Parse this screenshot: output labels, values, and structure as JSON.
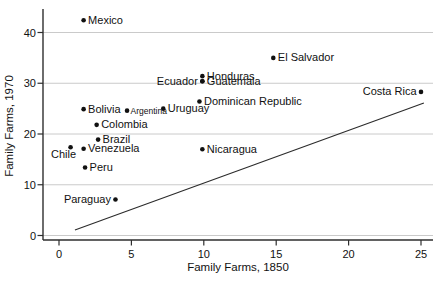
{
  "chart_data": {
    "type": "scatter",
    "title": "",
    "xlabel": "Family Farms, 1850",
    "ylabel": "Family Farms, 1970",
    "xlim": [
      0,
      25
    ],
    "ylim": [
      0,
      44
    ],
    "xticks": [
      0,
      5,
      10,
      15,
      20,
      25
    ],
    "yticks": [
      0,
      10,
      20,
      30,
      40
    ],
    "grid": "horizontal-gridlines-only",
    "legend": "none",
    "points": [
      {
        "label": "Mexico",
        "x": 1.7,
        "y": 42.4,
        "label_side": "right"
      },
      {
        "label": "El Salvador",
        "x": 14.8,
        "y": 35.0,
        "label_side": "right"
      },
      {
        "label": "Honduras",
        "x": 9.9,
        "y": 31.4,
        "label_side": "right"
      },
      {
        "label": "Ecuador",
        "x": 9.9,
        "y": 30.4,
        "label_side": "left"
      },
      {
        "label": "Guatemala",
        "x": 9.9,
        "y": 30.4,
        "label_side": "right"
      },
      {
        "label": "Costa Rica",
        "x": 25.0,
        "y": 28.3,
        "label_side": "left"
      },
      {
        "label": "Dominican Republic",
        "x": 9.7,
        "y": 26.4,
        "label_side": "right"
      },
      {
        "label": "Uruguay",
        "x": 7.2,
        "y": 25.0,
        "label_side": "right"
      },
      {
        "label": "Bolivia",
        "x": 1.7,
        "y": 24.9,
        "label_side": "right"
      },
      {
        "label": "Argentina",
        "x": 4.7,
        "y": 24.6,
        "label_side": "right",
        "small": true
      },
      {
        "label": "Colombia",
        "x": 2.6,
        "y": 21.8,
        "label_side": "right"
      },
      {
        "label": "Brazil",
        "x": 2.7,
        "y": 18.9,
        "label_side": "right"
      },
      {
        "label": "Chile",
        "x": 0.8,
        "y": 17.4,
        "label_side": "below-left"
      },
      {
        "label": "Venezuela",
        "x": 1.7,
        "y": 17.1,
        "label_side": "right"
      },
      {
        "label": "Nicaragua",
        "x": 9.9,
        "y": 17.0,
        "label_side": "right"
      },
      {
        "label": "Peru",
        "x": 1.8,
        "y": 13.4,
        "label_side": "right"
      },
      {
        "label": "Paraguay",
        "x": 3.9,
        "y": 7.1,
        "label_side": "left"
      }
    ],
    "trend_line": {
      "x1": 1.1,
      "y1": 1.1,
      "x2": 25.2,
      "y2": 26.1
    }
  },
  "colors": {
    "background": "#ffffff",
    "text": "#111111",
    "grid": "#c4c4c4",
    "axis": "#2e2e2e",
    "marker": "#111111",
    "trend": "#2b2b2b"
  }
}
